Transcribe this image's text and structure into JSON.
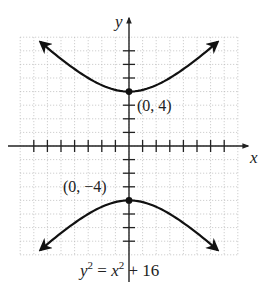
{
  "figure": {
    "equation_label": {
      "lhs_var": "y",
      "lhs_exp": "2",
      "eq": " = ",
      "rhs_var": "x",
      "rhs_exp": "2",
      "rhs_rest": " + 16"
    },
    "axis_labels": {
      "x": "x",
      "y": "y"
    },
    "points": [
      {
        "label": "(0, 4)",
        "x": 0,
        "y": 4
      },
      {
        "label": "(0, −4)",
        "x": 0,
        "y": -4
      }
    ],
    "colors": {
      "curve": "#111111",
      "axis": "#222222",
      "grid": "#b0b0b0",
      "text": "#222222"
    }
  },
  "chart_data": {
    "type": "line",
    "title": "",
    "equation": "y^2 = x^2 + 16",
    "xlabel": "x",
    "ylabel": "y",
    "xlim": [
      -8,
      8
    ],
    "ylim": [
      -8,
      8
    ],
    "grid": true,
    "tick_spacing": 1,
    "x_ticks": [
      -7,
      -6,
      -5,
      -4,
      -3,
      -2,
      -1,
      1,
      2,
      3,
      4,
      5,
      6,
      7
    ],
    "y_ticks": [
      -7,
      -6,
      -5,
      -4,
      -3,
      -2,
      -1,
      1,
      2,
      3,
      4,
      5,
      6,
      7
    ],
    "series": [
      {
        "name": "upper branch",
        "x": [
          -6.5,
          -5,
          -4,
          -3,
          -2,
          -1,
          0,
          1,
          2,
          3,
          4,
          5,
          6.5
        ],
        "y": [
          7.63,
          6.4,
          5.66,
          5.0,
          4.47,
          4.12,
          4.0,
          4.12,
          4.47,
          5.0,
          5.66,
          6.4,
          7.63
        ],
        "arrows_at_ends": true
      },
      {
        "name": "lower branch",
        "x": [
          -6.5,
          -5,
          -4,
          -3,
          -2,
          -1,
          0,
          1,
          2,
          3,
          4,
          5,
          6.5
        ],
        "y": [
          -7.63,
          -6.4,
          -5.66,
          -5.0,
          -4.47,
          -4.12,
          -4.0,
          -4.12,
          -4.47,
          -5.0,
          -5.66,
          -6.4,
          -7.63
        ],
        "arrows_at_ends": true
      }
    ],
    "annotations": [
      {
        "text": "(0, 4)",
        "x": 0,
        "y": 4
      },
      {
        "text": "(0, −4)",
        "x": 0,
        "y": -4
      },
      {
        "text": "y² = x² + 16",
        "position": "below graph"
      }
    ]
  }
}
